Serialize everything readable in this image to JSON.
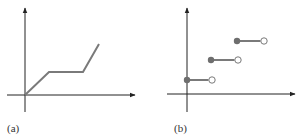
{
  "colors": {
    "axis": "#222222",
    "series": "#7a7a7a",
    "filled_point": "#6e6e6e",
    "open_point_fill": "#ffffff",
    "open_point_stroke": "#7a7a7a",
    "background": "#ffffff"
  },
  "panels": [
    {
      "id": "a",
      "label": "(a)"
    },
    {
      "id": "b",
      "label": "(b)"
    }
  ],
  "chart_data": [
    {
      "type": "line",
      "panel": "(a)",
      "title": "",
      "xlabel": "",
      "ylabel": "",
      "description": "Piecewise-linear continuous function: rises from origin, flat segment, then rises more steeply",
      "axes": {
        "origin_px": [
          25,
          95
        ],
        "x_axis_end_px": 135,
        "y_axis_top_px": 8,
        "y_axis_bottom_px": 112,
        "x_axis_start_px": 7
      },
      "series": [
        {
          "name": "f(x)",
          "points_px": [
            [
              25,
              95
            ],
            [
              49,
              72
            ],
            [
              83,
              72
            ],
            [
              99,
              44
            ]
          ],
          "points_relative": [
            [
              0,
              0
            ],
            [
              1,
              1
            ],
            [
              2.4,
              1
            ],
            [
              3.1,
              2.2
            ]
          ]
        }
      ],
      "grid": false,
      "legend": null
    },
    {
      "type": "step",
      "panel": "(b)",
      "title": "",
      "xlabel": "",
      "ylabel": "",
      "description": "Step function with three horizontal segments; closed (filled) dot at left end, open dot at right end of each step",
      "axes": {
        "origin_px": [
          187,
          94
        ],
        "x_axis_end_px": 295,
        "y_axis_top_px": 8,
        "y_axis_bottom_px": 112,
        "x_axis_start_px": 167
      },
      "series": [
        {
          "name": "steps",
          "segments_px": [
            {
              "x_start": 187,
              "x_end": 212,
              "y": 80,
              "start": "closed",
              "end": "open"
            },
            {
              "x_start": 211,
              "x_end": 238,
              "y": 60,
              "start": "closed",
              "end": "open"
            },
            {
              "x_start": 237,
              "x_end": 264,
              "y": 41,
              "start": "closed",
              "end": "open"
            }
          ],
          "segments_relative": [
            {
              "x": [
                0,
                1
              ],
              "y": 1
            },
            {
              "x": [
                1,
                2
              ],
              "y": 2
            },
            {
              "x": [
                2,
                3
              ],
              "y": 3
            }
          ]
        }
      ],
      "grid": false,
      "legend": null
    }
  ]
}
